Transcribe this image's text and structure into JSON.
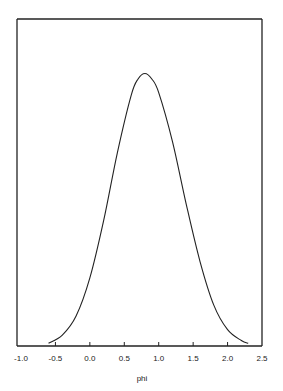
{
  "chart_data": {
    "type": "line",
    "title": "",
    "xlabel": "phi",
    "ylabel": "",
    "xlim": [
      -1.0,
      2.5
    ],
    "xticks": [
      "-1.0",
      "-0.5",
      "0.0",
      "0.5",
      "1.0",
      "1.5",
      "2.0",
      "2.5"
    ],
    "xtick_values": [
      -1.0,
      -0.5,
      0.0,
      0.5,
      1.0,
      1.5,
      2.0,
      2.5
    ],
    "yticks": [],
    "grid": false,
    "legend": "none",
    "series": [
      {
        "name": "density",
        "x": [
          -0.6,
          -0.4,
          -0.2,
          0.0,
          0.2,
          0.4,
          0.6,
          0.7,
          0.8,
          0.9,
          1.0,
          1.2,
          1.4,
          1.6,
          1.8,
          2.0,
          2.2,
          2.3
        ],
        "y": [
          0.01,
          0.04,
          0.11,
          0.25,
          0.46,
          0.71,
          0.92,
          0.98,
          1.0,
          0.98,
          0.93,
          0.75,
          0.52,
          0.31,
          0.15,
          0.06,
          0.02,
          0.01
        ]
      }
    ],
    "ylim": [
      0,
      1.2
    ]
  }
}
